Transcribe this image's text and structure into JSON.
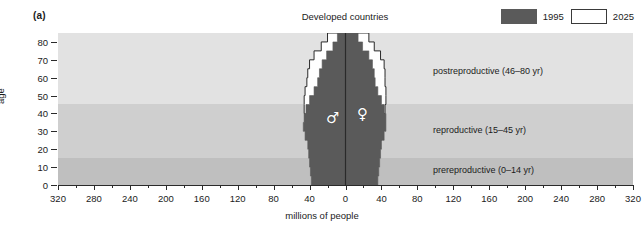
{
  "panel": {
    "label": "(a)"
  },
  "legend": {
    "items": [
      {
        "label": "1995",
        "swatch": "filled",
        "color": "#5a5a5a"
      },
      {
        "label": "2025",
        "swatch": "hollow",
        "color": "#ffffff"
      }
    ]
  },
  "glyphs": {
    "male": "♂",
    "female": "♀"
  },
  "chart_data": {
    "type": "bar",
    "title": "Developed countries",
    "xlabel": "millions of people",
    "ylabel": "age",
    "xlim": [
      -320,
      320
    ],
    "ylim": [
      0,
      85
    ],
    "grid": false,
    "legend_position": "top-right",
    "x_tick_labels": [
      "320",
      "280",
      "240",
      "200",
      "160",
      "120",
      "80",
      "40",
      "0",
      "40",
      "80",
      "120",
      "160",
      "200",
      "240",
      "280",
      "320"
    ],
    "x_tick_values": [
      -320,
      -280,
      -240,
      -200,
      -160,
      -120,
      -80,
      -40,
      0,
      40,
      80,
      120,
      160,
      200,
      240,
      280,
      320
    ],
    "y_tick_labels": [
      "0",
      "10",
      "20",
      "30",
      "40",
      "50",
      "60",
      "70",
      "80"
    ],
    "y_tick_values": [
      0,
      10,
      20,
      30,
      40,
      50,
      60,
      70,
      80
    ],
    "age_bands": [
      {
        "name": "prereproductive (0–14 yr)",
        "range": [
          0,
          15
        ],
        "color": "#bfbfbf"
      },
      {
        "name": "reproductive (15–45 yr)",
        "range": [
          15,
          45.5
        ],
        "color": "#cfcfcf"
      },
      {
        "name": "postreproductive (46–80 yr)",
        "range": [
          45.5,
          85
        ],
        "color": "#e2e2e2"
      }
    ],
    "age_groups": [
      "0-4",
      "5-9",
      "10-14",
      "15-19",
      "20-24",
      "25-29",
      "30-34",
      "35-39",
      "40-44",
      "45-49",
      "50-54",
      "55-59",
      "60-64",
      "65-69",
      "70-74",
      "75-79",
      "80+"
    ],
    "series": [
      {
        "name": "1995",
        "color": "#5a5a5a",
        "male": [
          38,
          39,
          40,
          41,
          42,
          45,
          47,
          46,
          44,
          40,
          35,
          31,
          29,
          26,
          21,
          14,
          9
        ],
        "female": [
          36,
          37,
          38,
          39,
          40,
          43,
          45,
          45,
          43,
          40,
          36,
          33,
          32,
          30,
          26,
          19,
          14
        ]
      },
      {
        "name": "2025",
        "color": "#ffffff",
        "male": [
          36,
          37,
          38,
          39,
          40,
          42,
          44,
          45,
          46,
          46,
          45,
          43,
          42,
          40,
          35,
          27,
          20
        ],
        "female": [
          34,
          35,
          36,
          37,
          38,
          40,
          42,
          43,
          44,
          45,
          45,
          44,
          44,
          43,
          39,
          32,
          26
        ]
      }
    ]
  }
}
